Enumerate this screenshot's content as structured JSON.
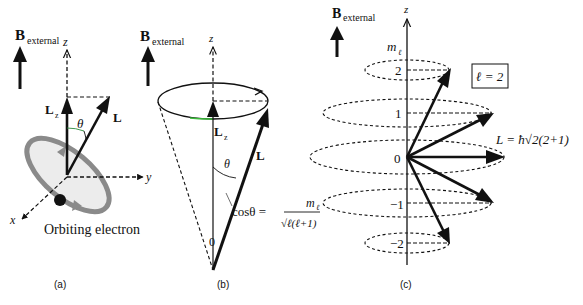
{
  "panel_a": {
    "caption": "(a)",
    "b_label_main": "B",
    "b_label_sub": "external",
    "z_label": "z",
    "y_label": "y",
    "x_label": "x",
    "lz_main": "L",
    "lz_sub": "z",
    "l_label": "L",
    "theta": "θ",
    "electron_label": "Orbiting electron"
  },
  "panel_b": {
    "caption": "(b)",
    "b_label_main": "B",
    "b_label_sub": "external",
    "z_label": "z",
    "lz_main": "L",
    "lz_sub": "z",
    "l_label": "L",
    "theta": "θ",
    "origin": "0",
    "formula_lhs": "cosθ =",
    "formula_num": "m",
    "formula_num_sub": "ℓ",
    "formula_den": "√ℓ(ℓ+1)"
  },
  "panel_c": {
    "caption": "(c)",
    "b_label_main": "B",
    "b_label_sub": "external",
    "z_label": "z",
    "m_label": "m",
    "m_sub": "ℓ",
    "box_label": "ℓ = 2",
    "l_formula": "L = ħ√2(2+1)",
    "levels": [
      {
        "m": "2"
      },
      {
        "m": "1"
      },
      {
        "m": "0"
      },
      {
        "m": "−1"
      },
      {
        "m": "−2"
      }
    ]
  }
}
